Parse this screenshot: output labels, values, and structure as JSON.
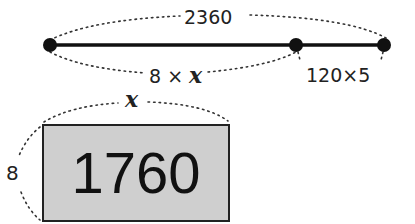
{
  "diagram": {
    "segment": {
      "total_label": "2360",
      "left_part_label_prefix": "8 × ",
      "left_part_variable": "x",
      "right_part_label": "120×5",
      "points": [
        {
          "name": "start",
          "x": 50,
          "y": 45
        },
        {
          "name": "split",
          "x": 296,
          "y": 45
        },
        {
          "name": "end",
          "x": 384,
          "y": 45
        }
      ]
    },
    "rectangle": {
      "width_label": "x",
      "height_label": "8",
      "area_label": "1760",
      "fill_color": "#cfcfcf",
      "border_color": "#222222"
    }
  }
}
